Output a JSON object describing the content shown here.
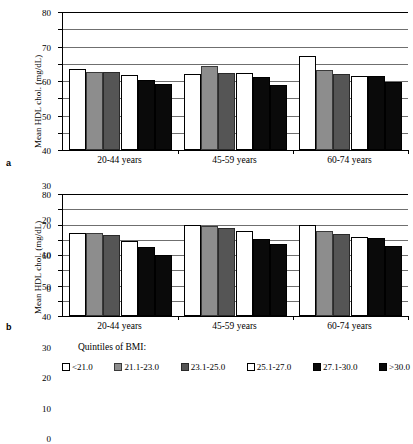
{
  "figure": {
    "panels": [
      {
        "letter": "a"
      },
      {
        "letter": "b"
      }
    ],
    "legend": {
      "title": "Quintiles of BMI:",
      "items": [
        {
          "label": "<21.0",
          "style": "s-white"
        },
        {
          "label": "21.1-23.0",
          "style": "s-lgray"
        },
        {
          "label": "23.1-25.0",
          "style": "s-dgray"
        },
        {
          "label": "25.1-27.0",
          "style": "s-white"
        },
        {
          "label": "27.1-30.0",
          "style": "s-black"
        },
        {
          "label": ">30.0",
          "style": "s-black"
        }
      ]
    }
  },
  "chart_data": [
    {
      "type": "bar",
      "panel": "a",
      "title": "",
      "xlabel": "",
      "ylabel": "Mean HDL chol. (mg/dL)",
      "ylim": [
        0,
        80
      ],
      "yticks": [
        0,
        10,
        20,
        30,
        40,
        50,
        60,
        70,
        80
      ],
      "grid": true,
      "legend_position": "bottom",
      "categories": [
        "20-44 years",
        "45-59 years",
        "60-74 years"
      ],
      "series": [
        {
          "name": "<21.0",
          "values": [
            47.0,
            44.0,
            54.5
          ]
        },
        {
          "name": "21.1-23.0",
          "values": [
            45.5,
            48.5,
            46.5
          ]
        },
        {
          "name": "23.1-25.0",
          "values": [
            45.5,
            44.5,
            44.0
          ]
        },
        {
          "name": "25.1-27.0",
          "values": [
            43.5,
            44.5,
            43.0
          ]
        },
        {
          "name": "27.1-30.0",
          "values": [
            40.5,
            42.5,
            43.0
          ]
        },
        {
          "name": ">30.0",
          "values": [
            38.5,
            37.5,
            39.5
          ]
        }
      ]
    },
    {
      "type": "bar",
      "panel": "b",
      "title": "",
      "xlabel": "",
      "ylabel": "Mean HDL chol. (mg/dL)",
      "ylim": [
        0,
        80
      ],
      "yticks": [
        0,
        10,
        20,
        30,
        40,
        50,
        60,
        70,
        80
      ],
      "grid": true,
      "legend_position": "bottom",
      "categories": [
        "20-44 years",
        "45-59 years",
        "60-74 years"
      ],
      "series": [
        {
          "name": "<21.0",
          "values": [
            54.5,
            59.5,
            59.5
          ]
        },
        {
          "name": "21.1-23.0",
          "values": [
            54.5,
            59.0,
            56.0
          ]
        },
        {
          "name": "23.1-25.0",
          "values": [
            53.0,
            57.5,
            53.5
          ]
        },
        {
          "name": "25.1-27.0",
          "values": [
            49.5,
            55.5,
            52.0
          ]
        },
        {
          "name": "27.1-30.0",
          "values": [
            45.5,
            50.5,
            51.0
          ]
        },
        {
          "name": ">30.0",
          "values": [
            40.0,
            47.0,
            46.0
          ]
        }
      ]
    }
  ]
}
